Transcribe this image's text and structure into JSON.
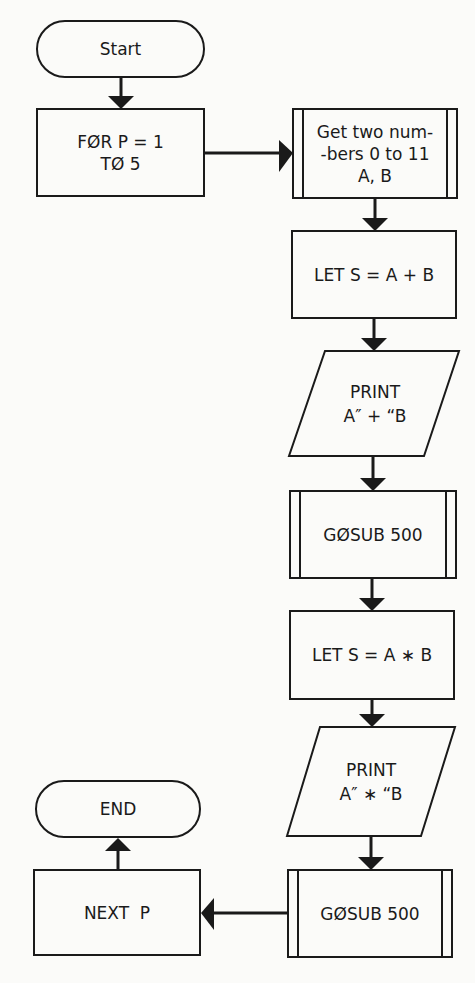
{
  "flowchart": {
    "nodes": {
      "start": {
        "type": "terminal",
        "label": "Start"
      },
      "for_loop": {
        "type": "process",
        "label": "FØR P = 1\nTØ 5"
      },
      "get_numbers": {
        "type": "subroutine",
        "label": "Get two num-\n-bers 0 to 11\nA, B"
      },
      "let_sum": {
        "type": "process",
        "label": "LET S = A + B"
      },
      "print_sum": {
        "type": "io",
        "label": "PRINT\nA″ + “B"
      },
      "gosub_1": {
        "type": "subroutine",
        "label": "GØSUB 500"
      },
      "let_product": {
        "type": "process",
        "label": "LET S = A ∗ B"
      },
      "print_product": {
        "type": "io",
        "label": "PRINT\nA″ ∗ “B"
      },
      "gosub_2": {
        "type": "subroutine",
        "label": "GØSUB 500"
      },
      "next_p": {
        "type": "process",
        "label": "NEXT  P"
      },
      "end": {
        "type": "terminal",
        "label": "END"
      }
    },
    "edges": [
      {
        "from": "start",
        "to": "for_loop"
      },
      {
        "from": "for_loop",
        "to": "get_numbers"
      },
      {
        "from": "get_numbers",
        "to": "let_sum"
      },
      {
        "from": "let_sum",
        "to": "print_sum"
      },
      {
        "from": "print_sum",
        "to": "gosub_1"
      },
      {
        "from": "gosub_1",
        "to": "let_product"
      },
      {
        "from": "let_product",
        "to": "print_product"
      },
      {
        "from": "print_product",
        "to": "gosub_2"
      },
      {
        "from": "gosub_2",
        "to": "next_p"
      },
      {
        "from": "next_p",
        "to": "end"
      }
    ]
  },
  "colors": {
    "ink": "#1a1a1a",
    "paper": "#fbfbf9"
  }
}
